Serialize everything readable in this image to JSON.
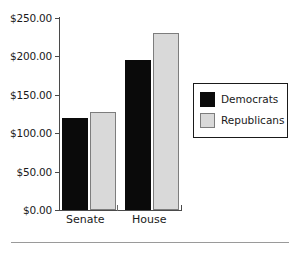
{
  "chart_data": {
    "type": "bar",
    "title": "",
    "subtitle": "",
    "xlabel": "",
    "ylabel": "",
    "categories": [
      "Senate",
      "House"
    ],
    "series": [
      {
        "name": "Democrats",
        "color": "#0a0a0a",
        "values": [
          120,
          195
        ]
      },
      {
        "name": "Republicans",
        "color": "#d9d9d9",
        "values": [
          128,
          230
        ]
      }
    ],
    "ylim": [
      0,
      250
    ],
    "y_ticks": [
      0,
      50,
      100,
      150,
      200,
      250
    ],
    "y_tick_labels": [
      "$0.00",
      "$50.00",
      "$100.00",
      "$150.00",
      "$200.00",
      "$250.00"
    ],
    "grid": false,
    "legend_position": "right"
  },
  "legend": {
    "entries": [
      {
        "label": "Democrats",
        "swatch": "legend-swatch-democrats"
      },
      {
        "label": "Republicans",
        "swatch": "legend-swatch-republicans"
      }
    ]
  },
  "axis": {
    "y_labels": [
      "$250.00",
      "$200.00",
      "$150.00",
      "$100.00",
      "$50.00",
      "$0.00"
    ],
    "x_labels": [
      "Senate",
      "House"
    ]
  }
}
